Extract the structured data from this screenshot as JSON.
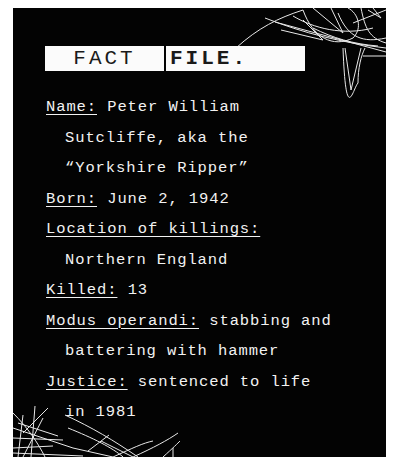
{
  "title": {
    "left": "FACT",
    "right": "FILE."
  },
  "facts": {
    "name": {
      "label": "Name:",
      "value": "Peter William",
      "cont1": "Sutcliffe, aka the",
      "cont2": "“Yorkshire Ripper”"
    },
    "born": {
      "label": "Born:",
      "value": "June 2, 1942"
    },
    "location": {
      "label": "Location of killings:",
      "cont1": "Northern England"
    },
    "killed": {
      "label": "Killed:",
      "value": "13"
    },
    "modus": {
      "label": "Modus operandi:",
      "value": "stabbing and",
      "cont1": "battering with hammer"
    },
    "justice": {
      "label": "Justice:",
      "value": "sentenced to life",
      "cont1": "in 1981"
    }
  },
  "colors": {
    "panel_bg": "#030303",
    "text": "#f2f2f2",
    "title_bg": "#fbfbfb",
    "title_text": "#1a1a1a"
  }
}
